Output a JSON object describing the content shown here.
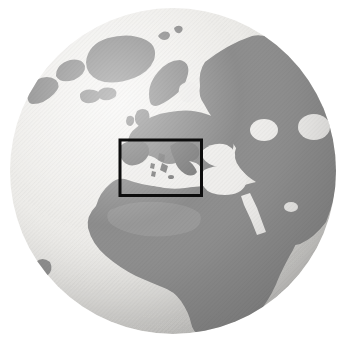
{
  "figure": {
    "kind": "grayscale-globe-photo",
    "depicts": [
      "Atlantic Ocean",
      "Arctic Ocean",
      "North America (edge)",
      "Greenland",
      "Iceland",
      "British Isles",
      "Scandinavia",
      "Europe",
      "Russia / Siberia",
      "Middle East",
      "Africa",
      "Mediterranean Sea (highlighted)"
    ]
  },
  "globe": {
    "center_x": 173,
    "center_y": 171,
    "radius": 163
  },
  "highlight_box": {
    "x": 120,
    "y": 140,
    "width": 81.5,
    "height": 55.5,
    "border_width": 3
  },
  "colors": {
    "background": "#ffffff",
    "ocean-1": "#f6f5f3",
    "ocean-2": "#edecE9",
    "ocean-3": "#d9d8d5",
    "ocean-4": "#b2b1af",
    "land": "#8d8d8d",
    "land-dark": "#7c7c7c",
    "land-light": "#a3a3a3",
    "sea-inset": "#efeeec",
    "highlight": "#0d0d0d"
  }
}
